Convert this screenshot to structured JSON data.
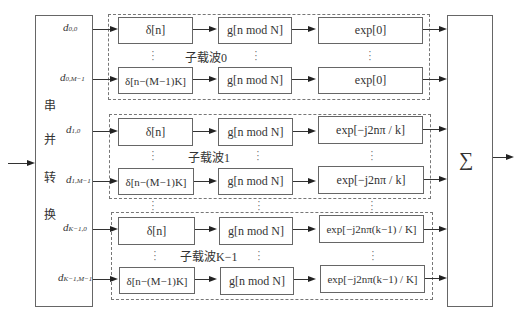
{
  "converter": {
    "chars": [
      "串",
      "并",
      "转",
      "换"
    ],
    "label": "串并转换"
  },
  "summer": {
    "symbol": "∑"
  },
  "groups": [
    {
      "label": "子载波0",
      "rows": [
        {
          "input": "d",
          "sub": "0,0",
          "delta": "δ[n]",
          "g": "g[n mod N]",
          "exp": "exp[0]"
        },
        {
          "input": "d",
          "sub": "0,M−1",
          "delta": "δ[n−(M−1)K]",
          "g": "g[n mod N]",
          "exp": "exp[0]"
        }
      ]
    },
    {
      "label": "子载波1",
      "rows": [
        {
          "input": "d",
          "sub": "1,0",
          "delta": "δ[n]",
          "g": "g[n mod N]",
          "exp": "exp[−j2nπ / k]"
        },
        {
          "input": "d",
          "sub": "1,M−1",
          "delta": "δ[n−(M−1)K]",
          "g": "g[n mod N]",
          "exp": "exp[−j2nπ / k]"
        }
      ]
    },
    {
      "label": "子载波K−1",
      "rows": [
        {
          "input": "d",
          "sub": "K−1,0",
          "delta": "δ[n]",
          "g": "g[n mod N]",
          "exp": "exp[−j2nπ(k−1) / K]"
        },
        {
          "input": "d",
          "sub": "K−1,M−1",
          "delta": "δ[n−(M−1)K]",
          "g": "g[n mod N]",
          "exp": "exp[−j2nπ(k−1) / K]"
        }
      ]
    }
  ]
}
